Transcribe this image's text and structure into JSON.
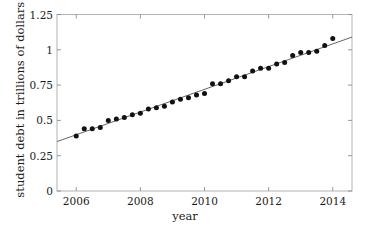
{
  "chart_data": {
    "type": "scatter",
    "title": "",
    "xlabel": "year",
    "ylabel": "student debt in trillions of dollars",
    "xlim": [
      2005.4,
      2014.6
    ],
    "ylim": [
      0,
      1.25
    ],
    "grid": false,
    "legend": null,
    "xticks": [
      2006,
      2008,
      2010,
      2012,
      2014
    ],
    "xtick_labels": [
      "2006",
      "2008",
      "2010",
      "2012",
      "2014"
    ],
    "yticks": [
      0,
      0.25,
      0.5,
      0.75,
      1,
      1.25
    ],
    "ytick_labels": [
      "0",
      "0.25",
      "0.5",
      "0.75",
      "1",
      "1.25"
    ],
    "series": [
      {
        "name": "student debt (quarterly)",
        "type": "scatter",
        "marker": "filled-circle",
        "color": "#111111",
        "x": [
          2006.0,
          2006.25,
          2006.5,
          2006.75,
          2007.0,
          2007.25,
          2007.5,
          2007.75,
          2008.0,
          2008.25,
          2008.5,
          2008.75,
          2009.0,
          2009.25,
          2009.5,
          2009.75,
          2010.0,
          2010.25,
          2010.5,
          2010.75,
          2011.0,
          2011.25,
          2011.5,
          2011.75,
          2012.0,
          2012.25,
          2012.5,
          2012.75,
          2013.0,
          2013.25,
          2013.5,
          2013.75,
          2014.0
        ],
        "y": [
          0.39,
          0.44,
          0.44,
          0.45,
          0.5,
          0.51,
          0.52,
          0.54,
          0.55,
          0.58,
          0.59,
          0.6,
          0.63,
          0.65,
          0.66,
          0.68,
          0.69,
          0.76,
          0.76,
          0.78,
          0.81,
          0.81,
          0.85,
          0.87,
          0.87,
          0.9,
          0.91,
          0.96,
          0.98,
          0.98,
          0.99,
          1.03,
          1.08
        ]
      },
      {
        "name": "linear trend line",
        "type": "line",
        "color": "#555555",
        "x": [
          2005.4,
          2014.6
        ],
        "y": [
          0.35,
          1.09
        ]
      }
    ]
  },
  "axes": {
    "xlabel": "year",
    "ylabel": "student debt in trillions of dollars",
    "xtick_labels": [
      "2006",
      "2008",
      "2010",
      "2012",
      "2014"
    ],
    "ytick_labels": [
      "0",
      "0.25",
      "0.5",
      "0.75",
      "1",
      "1.25"
    ]
  },
  "colors": {
    "background": "#ffffff",
    "axis_line": "#b4b4b4",
    "marker": "#111111",
    "trend_line": "#555555",
    "text": "#1a1a1a"
  }
}
